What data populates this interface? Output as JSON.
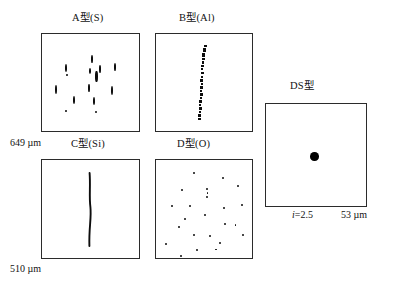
{
  "figure": {
    "type": "inclusion-rating-chart",
    "background": "#ffffff",
    "ink_color": "#0d0d0d",
    "bottom_caption": ""
  },
  "panels": [
    {
      "id": "A",
      "title": "A型(S)",
      "title_x": 72,
      "title_y": 13,
      "box": {
        "x": 41,
        "y": 33,
        "width": 99,
        "height": 99
      },
      "pattern": "short-vertical-streaks",
      "marks": [
        {
          "x": 49.0,
          "y": 21.0,
          "w": 2.0,
          "h": 8.0
        },
        {
          "x": 22.5,
          "y": 29.5,
          "w": 2.2,
          "h": 8.5
        },
        {
          "x": 57.0,
          "y": 31.0,
          "w": 2.2,
          "h": 7.5
        },
        {
          "x": 71.5,
          "y": 28.5,
          "w": 2.2,
          "h": 8.0
        },
        {
          "x": 46.5,
          "y": 34.0,
          "w": 2.0,
          "h": 6.0
        },
        {
          "x": 53.0,
          "y": 36.5,
          "w": 2.6,
          "h": 11.0
        },
        {
          "x": 24.0,
          "y": 40.0,
          "w": 2.0,
          "h": 2.2
        },
        {
          "x": 12.5,
          "y": 50.5,
          "w": 2.2,
          "h": 9.5
        },
        {
          "x": 45.5,
          "y": 50.0,
          "w": 2.0,
          "h": 7.5
        },
        {
          "x": 68.5,
          "y": 52.0,
          "w": 2.2,
          "h": 9.0
        },
        {
          "x": 31.0,
          "y": 61.5,
          "w": 2.2,
          "h": 8.5
        },
        {
          "x": 50.5,
          "y": 62.5,
          "w": 2.2,
          "h": 8.5
        },
        {
          "x": 22.5,
          "y": 76.0,
          "w": 2.0,
          "h": 2.2
        },
        {
          "x": 52.5,
          "y": 77.0,
          "w": 2.0,
          "h": 2.0
        }
      ]
    },
    {
      "id": "B",
      "title": "B型(Al)",
      "title_x": 179,
      "title_y": 13,
      "box": {
        "x": 155,
        "y": 33,
        "width": 98,
        "height": 99
      },
      "pattern": "aligned-dot-chain",
      "marks": [
        {
          "x": 47.5,
          "y": 11.0,
          "w": 3.0,
          "h": 2.4
        },
        {
          "x": 47.0,
          "y": 13.5,
          "w": 3.4,
          "h": 2.6
        },
        {
          "x": 46.5,
          "y": 16.0,
          "w": 3.0,
          "h": 2.4
        },
        {
          "x": 46.0,
          "y": 18.5,
          "w": 3.4,
          "h": 2.6
        },
        {
          "x": 46.0,
          "y": 21.0,
          "w": 2.6,
          "h": 2.4
        },
        {
          "x": 45.5,
          "y": 24.0,
          "w": 3.0,
          "h": 2.2
        },
        {
          "x": 45.5,
          "y": 27.0,
          "w": 2.2,
          "h": 2.6
        },
        {
          "x": 45.0,
          "y": 30.5,
          "w": 3.0,
          "h": 2.4
        },
        {
          "x": 45.0,
          "y": 34.0,
          "w": 2.4,
          "h": 2.2
        },
        {
          "x": 44.5,
          "y": 37.5,
          "w": 3.2,
          "h": 2.8
        },
        {
          "x": 44.5,
          "y": 41.5,
          "w": 2.2,
          "h": 2.0
        },
        {
          "x": 44.0,
          "y": 45.0,
          "w": 3.0,
          "h": 2.6
        },
        {
          "x": 44.5,
          "y": 48.5,
          "w": 2.4,
          "h": 2.2
        },
        {
          "x": 44.0,
          "y": 52.0,
          "w": 3.2,
          "h": 2.6
        },
        {
          "x": 44.0,
          "y": 55.5,
          "w": 2.2,
          "h": 2.2
        },
        {
          "x": 43.5,
          "y": 59.0,
          "w": 3.0,
          "h": 2.6
        },
        {
          "x": 43.5,
          "y": 62.5,
          "w": 2.6,
          "h": 2.2
        },
        {
          "x": 43.0,
          "y": 66.0,
          "w": 3.2,
          "h": 2.6
        },
        {
          "x": 43.0,
          "y": 69.5,
          "w": 2.4,
          "h": 2.2
        },
        {
          "x": 42.5,
          "y": 73.0,
          "w": 3.2,
          "h": 2.8
        },
        {
          "x": 42.5,
          "y": 76.5,
          "w": 2.6,
          "h": 2.4
        },
        {
          "x": 42.0,
          "y": 80.0,
          "w": 3.4,
          "h": 2.8
        },
        {
          "x": 42.0,
          "y": 83.5,
          "w": 2.6,
          "h": 2.4
        }
      ]
    },
    {
      "id": "C",
      "title": "C型(Si)",
      "title_x": 71,
      "title_y": 139,
      "box": {
        "x": 41,
        "y": 159,
        "width": 99,
        "height": 100
      },
      "pattern": "continuous-vertical-line"
    },
    {
      "id": "D",
      "title": "D型(O)",
      "title_x": 177,
      "title_y": 139,
      "box": {
        "x": 155,
        "y": 159,
        "width": 98,
        "height": 100
      },
      "pattern": "scattered-dots",
      "marks": [
        {
          "x": 36.5,
          "y": 12.0,
          "w": 2.0,
          "h": 2.0
        },
        {
          "x": 66.0,
          "y": 17.0,
          "w": 2.2,
          "h": 2.2
        },
        {
          "x": 25.0,
          "y": 29.0,
          "w": 2.0,
          "h": 2.0
        },
        {
          "x": 50.0,
          "y": 28.0,
          "w": 2.2,
          "h": 2.2
        },
        {
          "x": 50.5,
          "y": 32.0,
          "w": 1.8,
          "h": 1.8
        },
        {
          "x": 50.0,
          "y": 36.0,
          "w": 2.2,
          "h": 2.2
        },
        {
          "x": 81.0,
          "y": 25.0,
          "w": 2.2,
          "h": 2.2
        },
        {
          "x": 15.0,
          "y": 45.0,
          "w": 2.0,
          "h": 2.0
        },
        {
          "x": 33.0,
          "y": 44.5,
          "w": 2.2,
          "h": 2.2
        },
        {
          "x": 67.0,
          "y": 46.5,
          "w": 2.0,
          "h": 2.0
        },
        {
          "x": 85.0,
          "y": 44.0,
          "w": 2.2,
          "h": 2.2
        },
        {
          "x": 48.0,
          "y": 54.0,
          "w": 2.4,
          "h": 2.4
        },
        {
          "x": 28.0,
          "y": 58.0,
          "w": 2.2,
          "h": 2.2
        },
        {
          "x": 22.0,
          "y": 66.0,
          "w": 2.0,
          "h": 2.0
        },
        {
          "x": 67.5,
          "y": 63.0,
          "w": 2.0,
          "h": 2.0
        },
        {
          "x": 78.5,
          "y": 64.0,
          "w": 1.8,
          "h": 1.8
        },
        {
          "x": 37.0,
          "y": 73.5,
          "w": 2.0,
          "h": 2.0
        },
        {
          "x": 53.0,
          "y": 74.5,
          "w": 2.0,
          "h": 2.0
        },
        {
          "x": 85.5,
          "y": 74.0,
          "w": 2.2,
          "h": 2.2
        },
        {
          "x": 9.0,
          "y": 82.5,
          "w": 2.2,
          "h": 2.2
        },
        {
          "x": 63.0,
          "y": 81.5,
          "w": 2.2,
          "h": 2.2
        },
        {
          "x": 40.0,
          "y": 89.0,
          "w": 2.2,
          "h": 2.2
        },
        {
          "x": 59.0,
          "y": 88.5,
          "w": 1.8,
          "h": 1.8
        },
        {
          "x": 24.0,
          "y": 94.5,
          "w": 2.0,
          "h": 2.0
        }
      ]
    },
    {
      "id": "DS",
      "title": "DS型",
      "title_x": 290,
      "title_y": 81,
      "box": {
        "x": 265,
        "y": 103,
        "width": 102,
        "height": 104
      },
      "pattern": "single-large-globule",
      "globule": {
        "cx": 48,
        "cy": 52,
        "d": 8.5
      }
    }
  ],
  "scale_labels": [
    {
      "id": "height-649",
      "text": "649 µm",
      "x": 10,
      "y": 138
    },
    {
      "id": "height-510",
      "text": "510 µm",
      "x": 10,
      "y": 264
    },
    {
      "id": "ds-index",
      "italic_prefix": "i",
      "text": "=2.5",
      "x": 292,
      "y": 210
    },
    {
      "id": "ds-width",
      "text": "53 µm",
      "x": 341,
      "y": 210
    }
  ]
}
